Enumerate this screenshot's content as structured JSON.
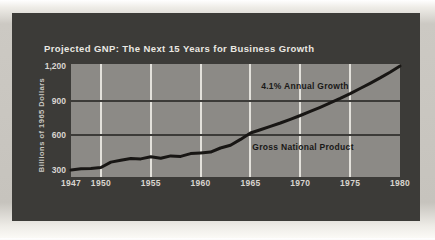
{
  "figure": {
    "title": "Projected GNP: The Next 15 Years for Business Growth"
  },
  "chart_data": {
    "type": "line",
    "title": "Projected GNP: The Next 15 Years for Business Growth",
    "xlabel": "",
    "ylabel": "Billions of 1965 Dollars",
    "xlim": [
      1947,
      1980
    ],
    "ylim": [
      300,
      1200
    ],
    "x_tick_labels": [
      "1947",
      "1950",
      "1955",
      "1960",
      "1965",
      "1970",
      "1975",
      "1980"
    ],
    "x_tick_years": [
      1947,
      1950,
      1955,
      1960,
      1965,
      1970,
      1975,
      1980
    ],
    "y_tick_labels": [
      "1,200",
      "900",
      "600",
      "300"
    ],
    "y_tick_values": [
      1200,
      900,
      600,
      300
    ],
    "x_gridline_years": [
      1950,
      1955,
      1960,
      1965,
      1970,
      1975
    ],
    "y_gridline_values": [
      900,
      600
    ],
    "grid": true,
    "legend_position": "none",
    "x": [
      1947,
      1948,
      1949,
      1950,
      1951,
      1952,
      1953,
      1954,
      1955,
      1956,
      1957,
      1958,
      1959,
      1960,
      1961,
      1962,
      1963,
      1964,
      1965,
      1966,
      1967,
      1968,
      1969,
      1970,
      1971,
      1972,
      1973,
      1974,
      1975,
      1976,
      1977,
      1978,
      1979,
      1980
    ],
    "series": [
      {
        "name": "Gross National Product",
        "values": [
          300,
          310,
          312,
          322,
          368,
          385,
          400,
          396,
          415,
          402,
          422,
          418,
          442,
          448,
          455,
          490,
          515,
          565,
          620,
          648,
          677,
          707,
          739,
          772,
          807,
          843,
          881,
          920,
          961,
          1005,
          1050,
          1097,
          1146,
          1200
        ]
      }
    ],
    "annotations": {
      "growth_label": "4.1% Annual Growth",
      "series_label": "Gross National Product"
    }
  },
  "colors": {
    "page_bg": "#c8c5bf",
    "card_bg": "#3c3b38",
    "plot_bg": "#8c8a86",
    "gridline_white": "#e3e1db",
    "gridline_dark": "#3c3b38",
    "line": "#181614",
    "title_text": "#eae8e2",
    "axis_text": "#d9d6d0",
    "annotation_text": "#191817"
  }
}
